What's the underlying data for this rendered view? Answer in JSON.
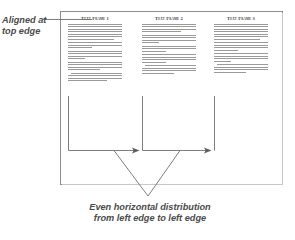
{
  "canvas": {
    "width": 295,
    "height": 240,
    "background": "#ffffff"
  },
  "page": {
    "border_color": "#8d8d8d",
    "background": "#ffffff"
  },
  "frames": [
    {
      "id": "frame-1",
      "heading": "Text Frame 1",
      "left_x": 68,
      "top_y": 16,
      "paragraph_count": 5
    },
    {
      "id": "frame-2",
      "heading": "Text Frame 2",
      "left_x": 142,
      "top_y": 16,
      "paragraph_count": 5
    },
    {
      "id": "frame-3",
      "heading": "Text Frame 3",
      "left_x": 214,
      "top_y": 16,
      "paragraph_count": 5
    }
  ],
  "annotations": {
    "top_left": {
      "line1": "Aligned at",
      "line2": "top edge"
    },
    "bottom": {
      "line1": "Even horizontal distribution",
      "line2": "from left edge to left edge"
    }
  },
  "guides": {
    "line_color": "#7d7d7d",
    "leader_color": "#6f6f6f",
    "vertical_x_positions": [
      68,
      142,
      214
    ],
    "vertical_top_y": 96,
    "vertical_bottom_y": 150,
    "arrow_targets_x": [
      138,
      210
    ],
    "v_apex": [
      148,
      196
    ]
  }
}
